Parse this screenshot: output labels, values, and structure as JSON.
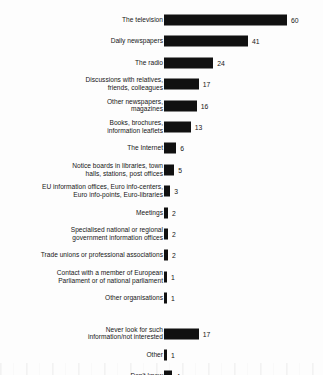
{
  "chart_data": {
    "type": "bar",
    "orientation": "horizontal",
    "title": "",
    "subtitle": "",
    "xlabel": "",
    "ylabel": "",
    "xlim": [
      0,
      60
    ],
    "grid": false,
    "legend": null,
    "value_suffix": "",
    "categories": [
      "The television",
      "Daily newspapers",
      "The radio",
      "Discussions with relatives,\nfriends, colleagues",
      "Other newspapers,\nmagazines",
      "Books, brochures,\ninformation leaflets",
      "The Internet",
      "Notice boards in libraries, town\nhalls, stations, post offices",
      "EU information offices, Euro info-centers,\nEuro info-points, Euro-libraries",
      "Meetings",
      "Specialised national or regional\ngovernment information offices",
      "Trade unions or professional associations",
      "Contact with a member of European\nParliament or of national parliament",
      "Other organisations",
      "Never look for such\ninformation/not interested",
      "Other",
      "Don't know"
    ],
    "values": [
      60,
      41,
      24,
      17,
      16,
      13,
      6,
      5,
      3,
      2,
      2,
      2,
      1,
      1,
      17,
      1,
      4
    ],
    "group_break_after_index": 13,
    "bar_color": "#111111",
    "text_color": "#161616",
    "background_color": "#fdfdfd"
  },
  "rows": [
    {
      "label": "The television",
      "value": 60,
      "value_text": "60"
    },
    {
      "label": "Daily newspapers",
      "value": 41,
      "value_text": "41"
    },
    {
      "label": "The radio",
      "value": 24,
      "value_text": "24"
    },
    {
      "label": "Discussions with relatives,\nfriends, colleagues",
      "value": 17,
      "value_text": "17"
    },
    {
      "label": "Other newspapers,\nmagazines",
      "value": 16,
      "value_text": "16"
    },
    {
      "label": "Books, brochures,\ninformation leaflets",
      "value": 13,
      "value_text": "13"
    },
    {
      "label": "The Internet",
      "value": 6,
      "value_text": "6"
    },
    {
      "label": "Notice boards in libraries, town\nhalls, stations, post offices",
      "value": 5,
      "value_text": "5"
    },
    {
      "label": "EU information offices, Euro info-centers,\nEuro info-points, Euro-libraries",
      "value": 3,
      "value_text": "3"
    },
    {
      "label": "Meetings",
      "value": 2,
      "value_text": "2"
    },
    {
      "label": "Specialised national or regional\ngovernment information offices",
      "value": 2,
      "value_text": "2"
    },
    {
      "label": "Trade unions or professional associations",
      "value": 2,
      "value_text": "2"
    },
    {
      "label": "Contact with a member of European\nParliament or of national parliament",
      "value": 1,
      "value_text": "1"
    },
    {
      "label": "Other organisations",
      "value": 1,
      "value_text": "1"
    },
    {
      "label": "Never look for such\ninformation/not interested",
      "value": 17,
      "value_text": "17"
    },
    {
      "label": "Other",
      "value": 1,
      "value_text": "1"
    },
    {
      "label": "Don't know",
      "value": 4,
      "value_text": "4"
    }
  ]
}
